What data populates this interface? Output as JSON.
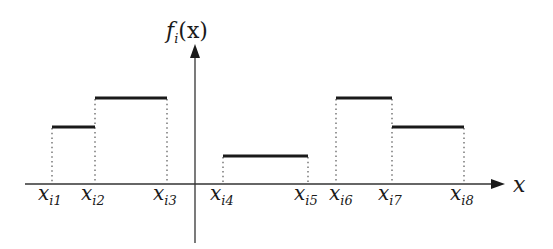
{
  "diagram": {
    "type": "piecewise-constant-function",
    "y_axis_label": {
      "main": "f",
      "sub": "i",
      "arg": "(x)"
    },
    "x_axis_label": "x",
    "breakpoints": [
      {
        "name": "x_i1",
        "main": "x",
        "sub": "i1"
      },
      {
        "name": "x_i2",
        "main": "x",
        "sub": "i2"
      },
      {
        "name": "x_i3",
        "main": "x",
        "sub": "i3"
      },
      {
        "name": "x_i4",
        "main": "x",
        "sub": "i4"
      },
      {
        "name": "x_i5",
        "main": "x",
        "sub": "i5"
      },
      {
        "name": "x_i6",
        "main": "x",
        "sub": "i6"
      },
      {
        "name": "x_i7",
        "main": "x",
        "sub": "i7"
      },
      {
        "name": "x_i8",
        "main": "x",
        "sub": "i8"
      }
    ],
    "segments": [
      {
        "from": "x_i1",
        "to": "x_i2",
        "level": "medium"
      },
      {
        "from": "x_i2",
        "to": "x_i3",
        "level": "high"
      },
      {
        "from": "x_i4",
        "to": "x_i5",
        "level": "low"
      },
      {
        "from": "x_i6",
        "to": "x_i7",
        "level": "high"
      },
      {
        "from": "x_i7",
        "to": "x_i8",
        "level": "medium"
      }
    ],
    "colors": {
      "line": "#1a1a1a",
      "axis": "#333333",
      "dotted": "#555555"
    }
  }
}
